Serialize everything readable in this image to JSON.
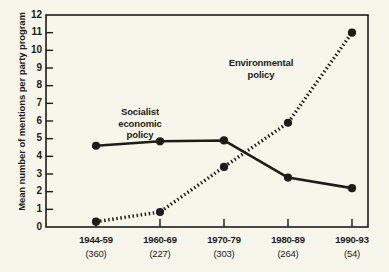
{
  "chart_data": {
    "type": "line",
    "title": "",
    "xlabel": "",
    "ylabel": "Mean number of mentions per party program",
    "categories": [
      "1944-59",
      "1960-69",
      "1970-79",
      "1980-89",
      "1990-93"
    ],
    "category_counts": [
      "(360)",
      "(227)",
      "(303)",
      "(264)",
      "(54)"
    ],
    "ylim": [
      0,
      12
    ],
    "yticks": [
      "0",
      "1",
      "2",
      "3",
      "4",
      "5",
      "6",
      "7",
      "8",
      "9",
      "10",
      "11",
      "12"
    ],
    "grid": false,
    "legend_position": "inline-annotations",
    "series": [
      {
        "name": "Socialist economic policy",
        "style": "solid",
        "color": "#1c1c18",
        "values": [
          4.6,
          4.85,
          4.9,
          2.8,
          2.2
        ]
      },
      {
        "name": "Environmental policy",
        "style": "dotted",
        "color": "#1c1c18",
        "values": [
          0.3,
          0.85,
          3.4,
          5.9,
          11.0
        ]
      }
    ],
    "annotations": [
      {
        "text_line1": "Socialist",
        "text_line2": "economic",
        "text_line3": "policy"
      },
      {
        "text_line1": "Environmental",
        "text_line2": "policy"
      }
    ]
  },
  "axis": {
    "y_label": "Mean number of mentions per party program",
    "y_ticks": [
      "12",
      "11",
      "10",
      "9",
      "8",
      "7",
      "6",
      "5",
      "4",
      "3",
      "2",
      "1",
      "0"
    ]
  },
  "labels": {
    "socialist_line1": "Socialist",
    "socialist_line2": "economic",
    "socialist_line3": "policy",
    "environmental_line1": "Environmental",
    "environmental_line2": "policy"
  },
  "colors": {
    "background": "#f7f6ea",
    "ink": "#1c1c18"
  }
}
